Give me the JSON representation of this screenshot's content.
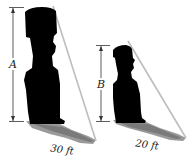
{
  "diagram": {
    "type": "similar-triangles-shadow",
    "objects": [
      {
        "id": "statue-large",
        "height_label": "A",
        "shadow_label": "30 ft",
        "shadow_length_ft": 30
      },
      {
        "id": "statue-small",
        "height_label": "B",
        "shadow_label": "20 ft",
        "shadow_length_ft": 20
      }
    ],
    "colors": {
      "silhouette": "#000000",
      "shadow": "#9a9a9a",
      "shadow_dark": "#6e6e6e",
      "ray": "#b8b8b8",
      "dimension_line": "#333333",
      "background": "#ffffff"
    }
  }
}
